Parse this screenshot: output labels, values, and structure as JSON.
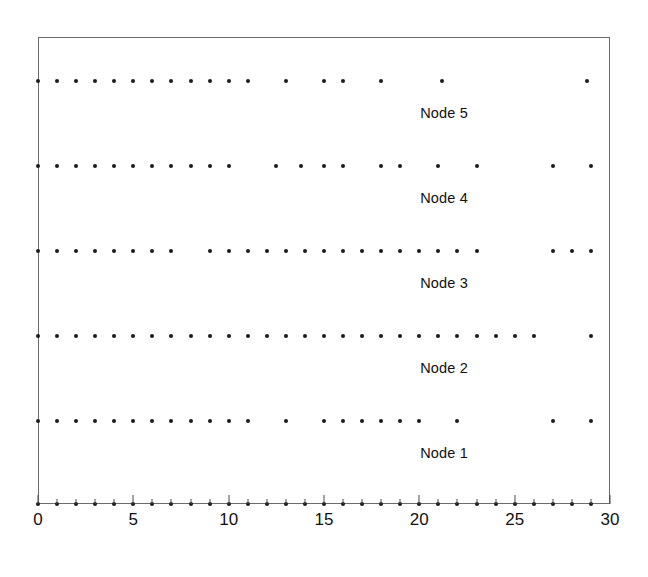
{
  "chart_data": {
    "type": "scatter",
    "title": "",
    "subtitle": "",
    "xlabel": "",
    "ylabel": "",
    "xlim": [
      0,
      30
    ],
    "ylim": [
      0,
      6
    ],
    "grid": false,
    "legend": "inline-labels",
    "x_ticks_major": [
      0,
      5,
      10,
      15,
      20,
      25,
      30
    ],
    "x_tick_labels": [
      "0",
      "5",
      "10",
      "15",
      "20",
      "25",
      "30"
    ],
    "x_ticks_minor": [
      1,
      2,
      3,
      4,
      6,
      7,
      8,
      9,
      11,
      12,
      13,
      14,
      16,
      17,
      18,
      19,
      21,
      22,
      23,
      24,
      26,
      27,
      28,
      29
    ],
    "y_tick_labels": [],
    "marker": "dot",
    "marker_color": "#1a1a1a",
    "marker_size_px": 4,
    "axis_color": "#6b6b6b",
    "background": "#ffffff",
    "series": [
      {
        "name": "Node 5",
        "label": "Node 5",
        "label_x": 21.3,
        "row_y_px": 81,
        "label_y_px": 105,
        "values": [
          0,
          1,
          2,
          3,
          4,
          5,
          6,
          7,
          8,
          9,
          10,
          11,
          13,
          15,
          16,
          18,
          21.2,
          28.8
        ]
      },
      {
        "name": "Node 4",
        "label": "Node 4",
        "label_x": 21.3,
        "row_y_px": 166,
        "label_y_px": 190,
        "values": [
          0,
          1,
          2,
          3,
          4,
          5,
          6,
          7,
          8,
          9,
          10,
          12.5,
          13.8,
          15,
          16,
          18,
          19,
          21,
          23,
          27,
          29
        ]
      },
      {
        "name": "Node 3",
        "label": "Node 3",
        "label_x": 21.3,
        "row_y_px": 251,
        "label_y_px": 275,
        "values": [
          0,
          1,
          2,
          3,
          4,
          5,
          6,
          7,
          9,
          10,
          11,
          12,
          13,
          14,
          15,
          16,
          17,
          18,
          19,
          20,
          21,
          22,
          23,
          27,
          28,
          29
        ]
      },
      {
        "name": "Node 2",
        "label": "Node 2",
        "label_x": 21.3,
        "row_y_px": 336,
        "label_y_px": 360,
        "values": [
          0,
          1,
          2,
          3,
          4,
          5,
          6,
          7,
          8,
          9,
          10,
          11,
          12,
          13,
          14,
          15,
          16,
          17,
          18,
          19,
          20,
          21,
          22,
          23,
          24,
          25,
          26,
          29
        ]
      },
      {
        "name": "Node 1",
        "label": "Node 1",
        "label_x": 21.3,
        "row_y_px": 421,
        "label_y_px": 445,
        "values": [
          0,
          1,
          2,
          3,
          4,
          5,
          6,
          7,
          8,
          9,
          10,
          11,
          13,
          15,
          16,
          17,
          18,
          19,
          20,
          22,
          27,
          29
        ]
      },
      {
        "name": "Axis events",
        "label": "",
        "label_x": null,
        "row_y_px": 504,
        "label_y_px": null,
        "values": [
          0,
          1,
          2,
          3,
          4,
          5,
          6,
          7,
          8,
          9,
          10,
          11,
          12,
          13,
          14,
          15,
          16,
          17,
          18,
          19,
          20,
          21,
          22,
          23,
          24,
          25,
          26,
          27,
          28,
          29
        ]
      }
    ]
  },
  "geometry": {
    "plot_left_px": 38,
    "plot_right_px": 610,
    "plot_top_px": 37,
    "plot_bottom_px": 504,
    "x_min": 0,
    "x_max": 30,
    "tick_label_y_px": 510
  }
}
